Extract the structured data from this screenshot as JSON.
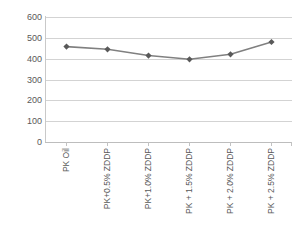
{
  "chart_data": {
    "type": "line",
    "title": "",
    "xlabel": "",
    "ylabel": "",
    "ylim": [
      0,
      600
    ],
    "ytick_step": 100,
    "yticks": [
      "600",
      "500",
      "400",
      "300",
      "200",
      "100",
      "0"
    ],
    "grid": true,
    "legend": "none",
    "categories": [
      "PK Oil",
      "PK+0.5% ZDDP",
      "PK+1.0% ZDDP",
      "PK + 1.5% ZDDP",
      "PK + 2.0% ZDDP",
      "PK + 2.5% ZDDP"
    ],
    "series": [
      {
        "name": "series-1",
        "values": [
          458,
          445,
          415,
          397,
          421,
          480
        ],
        "line_color": "#808080",
        "marker_color": "#595959",
        "marker": "diamond"
      }
    ]
  },
  "axes": {
    "y_tick_labels": [
      "600",
      "500",
      "400",
      "300",
      "200",
      "100",
      "0"
    ],
    "x_tick_labels": [
      "PK Oil",
      "PK+0.5% ZDDP",
      "PK+1.0% ZDDP",
      "PK + 1.5% ZDDP",
      "PK + 2.0% ZDDP",
      "PK + 2.5% ZDDP"
    ]
  },
  "colors": {
    "gridline": "#d3d3d3",
    "axis": "#c2c2c2",
    "line": "#808080",
    "marker": "#595959",
    "tick_text": "#595959",
    "background": "#ffffff"
  }
}
